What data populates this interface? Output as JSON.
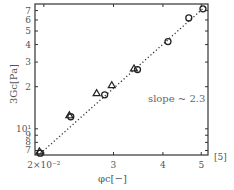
{
  "chart_data": {
    "type": "scatter",
    "title": "",
    "xlabel": "φc[−]",
    "ylabel": "3Gc[Pa]",
    "xscale": "log",
    "yscale": "log",
    "xlim": [
      0.019,
      0.052
    ],
    "ylim": [
      6.5,
      78
    ],
    "x_ticks": [
      {
        "value": 0.02,
        "label": "2×10⁻²"
      },
      {
        "value": 0.03,
        "label": "3"
      },
      {
        "value": 0.04,
        "label": "4"
      },
      {
        "value": 0.05,
        "label": "5"
      }
    ],
    "y_ticks": [
      {
        "value": 7,
        "label": "7"
      },
      {
        "value": 8,
        "label": "8"
      },
      {
        "value": 9,
        "label": "9"
      },
      {
        "value": 10,
        "label": "10¹"
      },
      {
        "value": 20,
        "label": "2"
      },
      {
        "value": 30,
        "label": "3"
      },
      {
        "value": 40,
        "label": "4"
      },
      {
        "value": 50,
        "label": "5"
      },
      {
        "value": 60,
        "label": "6"
      },
      {
        "value": 70,
        "label": "7"
      }
    ],
    "grid": false,
    "legend": null,
    "series": [
      {
        "name": "triangles",
        "marker": "triangle",
        "x": [
          0.0195,
          0.0232,
          0.0272,
          0.0297,
          0.0338
        ],
        "y": [
          6.9,
          12.5,
          18,
          20.5,
          27
        ]
      },
      {
        "name": "circles",
        "marker": "circle",
        "x": [
          0.0196,
          0.0234,
          0.0285,
          0.0345,
          0.0412,
          0.0465,
          0.0505
        ],
        "y": [
          6.7,
          12.2,
          17.5,
          26.5,
          42,
          62,
          72
        ]
      }
    ],
    "fit_line": {
      "style": "dotted",
      "x": [
        0.0193,
        0.0512
      ],
      "y": [
        6.4,
        75
      ]
    },
    "annotations": [
      {
        "text": "slope ~ 2.3"
      }
    ]
  },
  "labels": {
    "slope": "slope ~ 2.3",
    "ylabel": "3Gc[Pa]",
    "xlabel": "φc[−]",
    "corner_mark": "[5]"
  }
}
